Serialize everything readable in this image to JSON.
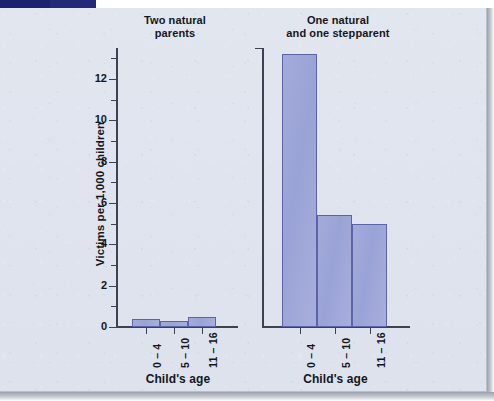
{
  "figure": {
    "y_axis_title": "Victims per 1,000 children",
    "panels": [
      {
        "id": "left",
        "title_line1": "Two natural",
        "title_line2": "parents",
        "x_axis_title": "Child's age"
      },
      {
        "id": "right",
        "title_line1": "One natural",
        "title_line2": "and one stepparent",
        "x_axis_title": "Child's age"
      }
    ],
    "y_tick_labels": [
      "0",
      "2",
      "4",
      "6",
      "8",
      "10",
      "12"
    ],
    "category_labels": [
      "0 – 4",
      "5 – 10",
      "11 – 16"
    ],
    "colors": {
      "bar_fill": "#9fa8d8",
      "bar_stroke": "#5d63a8",
      "paper": "#dfe4ee",
      "axis": "#3c4252",
      "text": "#14161c",
      "top_strip": "#23287a"
    }
  },
  "chart_data": {
    "type": "bar",
    "xlabel": "Child's age",
    "ylabel": "Victims per 1,000 children",
    "ylim": [
      0,
      13.5
    ],
    "yticks": [
      0,
      2,
      4,
      6,
      8,
      10,
      12
    ],
    "yticks_minor": [
      1,
      3,
      5,
      7,
      9,
      11,
      13
    ],
    "grid": false,
    "legend": null,
    "categories": [
      "0 – 4",
      "5 – 10",
      "11 – 16"
    ],
    "panels": [
      {
        "name": "Two natural parents",
        "values": [
          0.4,
          0.3,
          0.5
        ]
      },
      {
        "name": "One natural and one stepparent",
        "values": [
          13.2,
          5.4,
          5.0
        ]
      }
    ]
  }
}
